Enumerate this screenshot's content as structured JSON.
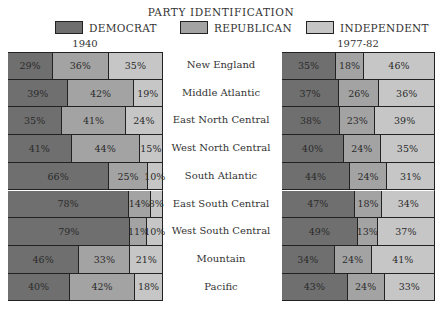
{
  "title": "PARTY IDENTIFICATION",
  "legend": [
    {
      "label": "DEMOCRAT",
      "color": "#6f6f6f"
    },
    {
      "label": "REPUBLICAN",
      "color": "#a3a3a3"
    },
    {
      "label": "INDEPENDENT",
      "color": "#c6c6c6"
    }
  ],
  "panels": {
    "left_title": "1940",
    "right_title": "1977-82"
  },
  "chart_data": {
    "type": "bar",
    "subtype": "stacked-horizontal-100pct",
    "title": "PARTY IDENTIFICATION",
    "categories": [
      "New England",
      "Middle Atlantic",
      "East North Central",
      "West North Central",
      "South Atlantic",
      "East South Central",
      "West South Central",
      "Mountain",
      "Pacific"
    ],
    "panels": [
      {
        "name": "1940",
        "series": [
          {
            "name": "DEMOCRAT",
            "values": [
              29,
              39,
              35,
              41,
              66,
              78,
              79,
              46,
              40
            ]
          },
          {
            "name": "REPUBLICAN",
            "values": [
              36,
              42,
              41,
              44,
              25,
              14,
              11,
              33,
              42
            ]
          },
          {
            "name": "INDEPENDENT",
            "values": [
              35,
              19,
              24,
              15,
              10,
              8,
              10,
              21,
              18
            ]
          }
        ]
      },
      {
        "name": "1977-82",
        "series": [
          {
            "name": "DEMOCRAT",
            "values": [
              35,
              37,
              38,
              40,
              44,
              47,
              49,
              34,
              43
            ]
          },
          {
            "name": "REPUBLICAN",
            "values": [
              18,
              26,
              23,
              24,
              24,
              18,
              13,
              24,
              24
            ]
          },
          {
            "name": "INDEPENDENT",
            "values": [
              46,
              36,
              39,
              35,
              31,
              34,
              37,
              41,
              33
            ]
          }
        ]
      }
    ],
    "legend_position": "top",
    "grid": false,
    "value_labels": "percent"
  }
}
